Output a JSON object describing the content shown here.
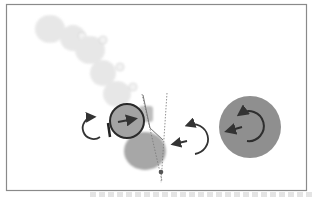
{
  "figure": {
    "colors": {
      "frame": "#8a8a8a",
      "ghost": "#d9d9d9",
      "body": "#9a9a9a",
      "large_disc": "#8f8f8f",
      "arrow": "#333333",
      "outline": "#2a2a2a",
      "dotted_line": "#777777"
    },
    "elements": {
      "ghost_sequence_count": 6,
      "rotation_arrows": 3,
      "translation_arrows": 3,
      "pivot_point": 1
    }
  },
  "caption": {
    "visible_text": ""
  }
}
